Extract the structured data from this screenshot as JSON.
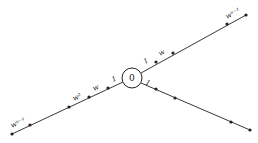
{
  "diagram": {
    "center_label": "0",
    "branches": [
      {
        "name": "upper-right",
        "labels": {
          "first": "1",
          "second": "w",
          "end": "w^{n-1}"
        },
        "end_label_text": "wⁿ⁻¹"
      },
      {
        "name": "left",
        "labels": {
          "first": "1",
          "second": "w",
          "third": "w²",
          "end": "w^{n-1}"
        },
        "end_label_text": "wⁿ⁻¹"
      },
      {
        "name": "lower-right",
        "labels": {
          "first": "1"
        }
      }
    ],
    "colors": {
      "line": "#222222",
      "background": "#ffffff"
    }
  }
}
